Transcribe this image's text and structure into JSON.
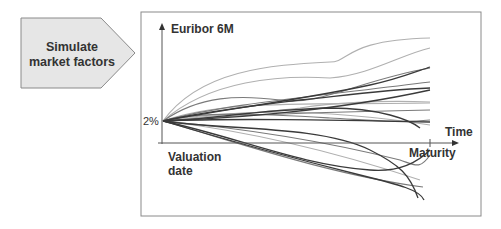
{
  "process_step": {
    "label_line1": "Simulate",
    "label_line2": "market factors"
  },
  "chart": {
    "y_axis_label": "Euribor 6M",
    "x_axis_label": "Time",
    "start_value_label": "2%",
    "origin_label_line1": "Valuation",
    "origin_label_line2": "date",
    "end_tick_label": "Maturity"
  },
  "colors": {
    "step_fill": "#e6e6e6",
    "step_border": "#8a8a8a",
    "frame_border": "#8a8a8a",
    "axis": "#555555",
    "text": "#333333"
  }
}
